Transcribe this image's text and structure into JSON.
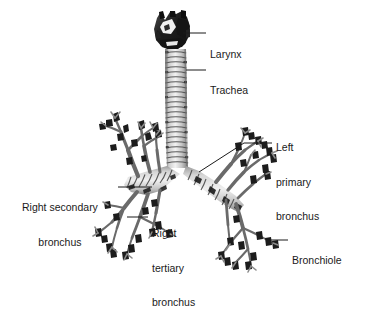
{
  "figure": {
    "background_color": "#ffffff",
    "ink_color": "#1a1a1a",
    "specimen_light": "#d9d9d9",
    "specimen_mid": "#9a9a9a",
    "specimen_dark": "#2b2b2b"
  },
  "labels": [
    {
      "id": "larynx",
      "name": "larynx-label",
      "lines": [
        "Larynx"
      ],
      "text_x": 210,
      "text_y": 26,
      "leader": {
        "x1": 183,
        "y1": 33,
        "x2": 206,
        "y2": 33
      }
    },
    {
      "id": "trachea",
      "name": "trachea-label",
      "lines": [
        "Trachea"
      ],
      "text_x": 210,
      "text_y": 62,
      "leader": {
        "x1": 186,
        "y1": 70,
        "x2": 206,
        "y2": 70
      }
    },
    {
      "id": "left_primary_bronchus",
      "name": "left-primary-bronchus-label",
      "lines": [
        "Left",
        "primary",
        "bronchus"
      ],
      "text_x": 276,
      "text_y": 119,
      "leader": {
        "x1": 199,
        "y1": 172,
        "x2": 244,
        "y2": 143,
        "x3": 272,
        "y3": 143
      }
    },
    {
      "id": "right_secondary_bronchus",
      "name": "right-secondary-bronchus-label",
      "lines": [
        "Right secondary",
        "bronchus"
      ],
      "text_x": 22,
      "text_y": 179,
      "leader": {
        "x1": 118,
        "y1": 187,
        "x2": 152,
        "y2": 187
      }
    },
    {
      "id": "right_tertiary_bronchus",
      "name": "right-tertiary-bronchus-label",
      "lines": [
        "Right",
        "tertiary",
        "bronchus"
      ],
      "text_x": 152,
      "text_y": 205,
      "leader": {
        "x1": 127,
        "y1": 217,
        "x2": 148,
        "y2": 217
      }
    },
    {
      "id": "bronchiole",
      "name": "bronchiole-label",
      "lines": [
        "Bronchiole"
      ],
      "text_x": 292,
      "text_y": 232,
      "leader": {
        "x1": 266,
        "y1": 240,
        "x2": 288,
        "y2": 240
      }
    }
  ]
}
